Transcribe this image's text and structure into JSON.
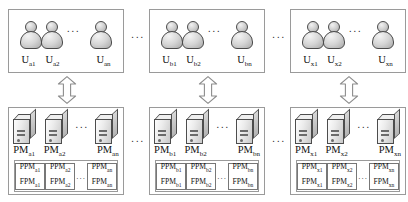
{
  "diagram": {
    "ellipsis": "...",
    "group_separator": "...",
    "arrow_name": "bidirectional-arrow",
    "groups": [
      {
        "id": "a",
        "users": {
          "items": [
            {
              "base": "U",
              "sub": "a1"
            },
            {
              "base": "U",
              "sub": "a2"
            },
            {
              "base": "U",
              "sub": "an"
            }
          ]
        },
        "machines": {
          "items": [
            {
              "base": "PM",
              "sub": "a1"
            },
            {
              "base": "PM",
              "sub": "a2"
            },
            {
              "base": "PM",
              "sub": "an"
            }
          ],
          "modules": [
            {
              "ppm": "PPM",
              "ppm_sub": "a1",
              "fpm": "FPM",
              "fpm_sub": "a1"
            },
            {
              "ppm": "PPM",
              "ppm_sub": "a2",
              "fpm": "FPM",
              "fpm_sub": "a2"
            },
            {
              "ppm": "PPM",
              "ppm_sub": "an",
              "fpm": "FPM",
              "fpm_sub": "an"
            }
          ]
        }
      },
      {
        "id": "b",
        "users": {
          "items": [
            {
              "base": "U",
              "sub": "b1"
            },
            {
              "base": "U",
              "sub": "b2"
            },
            {
              "base": "U",
              "sub": "bn"
            }
          ]
        },
        "machines": {
          "items": [
            {
              "base": "PM",
              "sub": "b1"
            },
            {
              "base": "PM",
              "sub": "b2"
            },
            {
              "base": "PM",
              "sub": "bn"
            }
          ],
          "modules": [
            {
              "ppm": "PPM",
              "ppm_sub": "b1",
              "fpm": "FPM",
              "fpm_sub": "b1"
            },
            {
              "ppm": "PPM",
              "ppm_sub": "b2",
              "fpm": "FPM",
              "fpm_sub": "b2"
            },
            {
              "ppm": "PPM",
              "ppm_sub": "bn",
              "fpm": "FPM",
              "fpm_sub": "bn"
            }
          ]
        }
      },
      {
        "id": "x",
        "users": {
          "items": [
            {
              "base": "U",
              "sub": "x1"
            },
            {
              "base": "U",
              "sub": "x2"
            },
            {
              "base": "U",
              "sub": "xn"
            }
          ]
        },
        "machines": {
          "items": [
            {
              "base": "PM",
              "sub": "x1"
            },
            {
              "base": "PM",
              "sub": "x2"
            },
            {
              "base": "PM",
              "sub": "xn"
            }
          ],
          "modules": [
            {
              "ppm": "PPM",
              "ppm_sub": "x1",
              "fpm": "FPM",
              "fpm_sub": "x1"
            },
            {
              "ppm": "PPM",
              "ppm_sub": "x2",
              "fpm": "FPM",
              "fpm_sub": "x2"
            },
            {
              "ppm": "PPM",
              "ppm_sub": "xn",
              "fpm": "FPM",
              "fpm_sub": "xn"
            }
          ]
        }
      }
    ],
    "colors": {
      "box_border": "#9a9a9a",
      "icon_outline": "#4a4a4a",
      "background": "#ffffff",
      "text": "#111111"
    }
  }
}
